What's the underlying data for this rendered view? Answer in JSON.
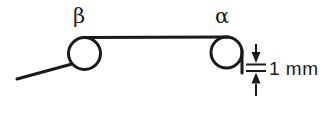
{
  "figure": {
    "background_color": "#ffffff",
    "ink_color": "#1a1a1a"
  },
  "labels": {
    "left_pulley": "β",
    "right_pulley": "α",
    "dimension": "1 mm"
  },
  "pulleys": [
    {
      "name": "left-pulley",
      "label": "β",
      "cx": 84.5,
      "cy": 53.5,
      "r": 16.0,
      "stroke_width": 3.0
    },
    {
      "name": "right-pulley",
      "label": "α",
      "cx": 226.5,
      "cy": 52.5,
      "r": 15.5,
      "stroke_width": 3.0
    }
  ],
  "paths": {
    "entry_line": {
      "name": "incoming-filament",
      "from": [
        17,
        79
      ],
      "to": [
        71,
        64
      ],
      "stroke_width": 3.0
    },
    "span_line": {
      "name": "horizontal-span",
      "from": [
        84,
        37
      ],
      "to": [
        227,
        37
      ],
      "stroke_width": 3.0
    },
    "drop_line": {
      "name": "vertical-drop",
      "from": [
        242,
        52
      ],
      "to": [
        242,
        73
      ],
      "stroke_width": 3.0
    }
  },
  "dimension": {
    "name": "one-millimeter-dimension",
    "text": "1 mm",
    "value": 1,
    "unit": "mm",
    "text_x": 268,
    "text_y": 75,
    "arrow_x": 256,
    "upper_arrow": {
      "tail_y": 44,
      "head_y": 62
    },
    "lower_arrow": {
      "tail_y": 96,
      "head_y": 74
    },
    "tick_upper": {
      "y": 64,
      "x1": 246,
      "x2": 266
    },
    "tick_lower": {
      "y": 71,
      "x1": 246,
      "x2": 266
    }
  },
  "label_positions": {
    "left_pulley_label": {
      "x": 79,
      "y": 22
    },
    "right_pulley_label": {
      "x": 221,
      "y": 22
    }
  }
}
